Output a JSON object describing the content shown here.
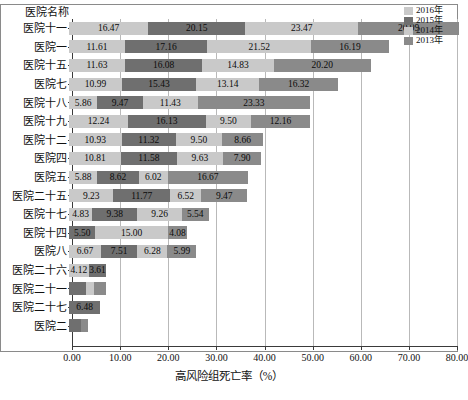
{
  "axis_header": "医院名称",
  "legend": {
    "position": "top-right",
    "items": [
      {
        "label": "2016年",
        "color": "#c9c9c9"
      },
      {
        "label": "2015年",
        "color": "#6f6f6f"
      },
      {
        "label": "2014年",
        "color": "#c9c9c9"
      },
      {
        "label": "2013年",
        "color": "#8a8a8a"
      }
    ]
  },
  "chart_data": {
    "type": "bar",
    "orientation": "horizontal",
    "stacked": true,
    "title": "",
    "xlabel": "高风险组死亡率（%）",
    "ylabel": "医院名称",
    "xlim": [
      0,
      80
    ],
    "xticks": [
      "0.00",
      "10.00",
      "20.00",
      "30.00",
      "40.00",
      "50.00",
      "60.00",
      "70.00",
      "80.00"
    ],
    "xtick_values": [
      0,
      10,
      20,
      30,
      40,
      50,
      60,
      70,
      80
    ],
    "grid": true,
    "series": [
      {
        "name": "2016年",
        "color": "#c9c9c9"
      },
      {
        "name": "2015年",
        "color": "#6f6f6f"
      },
      {
        "name": "2014年",
        "color": "#c9c9c9"
      },
      {
        "name": "2013年",
        "color": "#8a8a8a"
      }
    ],
    "categories": [
      "医院十一",
      "医院一",
      "医院十五",
      "医院七",
      "医院十八",
      "医院十九",
      "医院十二",
      "医院四",
      "医院五",
      "医院二十五",
      "医院十七",
      "医院十四",
      "医院八",
      "医院二十六",
      "医院二十一",
      "医院二十七",
      "医院二"
    ],
    "rows": [
      {
        "category": "医院十一",
        "segments": [
          {
            "series": "2016年",
            "value": 16.47,
            "label": "16.47"
          },
          {
            "series": "2015年",
            "value": 20.15,
            "label": "20.15"
          },
          {
            "series": "2014年",
            "value": 23.47,
            "label": "23.47"
          },
          {
            "series": "2013年",
            "value": 20.99,
            "label": "20.99"
          }
        ],
        "total": 81.08
      },
      {
        "category": "医院一",
        "segments": [
          {
            "series": "2016年",
            "value": 11.61,
            "label": "11.61"
          },
          {
            "series": "2015年",
            "value": 17.16,
            "label": "17.16"
          },
          {
            "series": "2014年",
            "value": 21.52,
            "label": "21.52"
          },
          {
            "series": "2013年",
            "value": 16.19,
            "label": "16.19"
          }
        ],
        "total": 66.48
      },
      {
        "category": "医院十五",
        "segments": [
          {
            "series": "2016年",
            "value": 11.63,
            "label": "11.63"
          },
          {
            "series": "2015年",
            "value": 16.08,
            "label": "16.08"
          },
          {
            "series": "2014年",
            "value": 14.83,
            "label": "14.83"
          },
          {
            "series": "2013年",
            "value": 20.2,
            "label": "20.20"
          }
        ],
        "total": 62.74
      },
      {
        "category": "医院七",
        "segments": [
          {
            "series": "2016年",
            "value": 10.99,
            "label": "10.99"
          },
          {
            "series": "2015年",
            "value": 15.43,
            "label": "15.43"
          },
          {
            "series": "2014年",
            "value": 13.14,
            "label": "13.14"
          },
          {
            "series": "2013年",
            "value": 16.32,
            "label": "16.32"
          }
        ],
        "total": 55.88
      },
      {
        "category": "医院十八",
        "segments": [
          {
            "series": "2016年",
            "value": 5.86,
            "label": "5.86"
          },
          {
            "series": "2015年",
            "value": 9.47,
            "label": "9.47"
          },
          {
            "series": "2014年",
            "value": 11.43,
            "label": "11.43"
          },
          {
            "series": "2013年",
            "value": 23.33,
            "label": "23.33"
          }
        ],
        "total": 50.09
      },
      {
        "category": "医院十九",
        "segments": [
          {
            "series": "2016年",
            "value": 12.24,
            "label": "12.24"
          },
          {
            "series": "2015年",
            "value": 16.13,
            "label": "16.13"
          },
          {
            "series": "2014年",
            "value": 9.5,
            "label": "9.50"
          },
          {
            "series": "2013年",
            "value": 12.16,
            "label": "12.16"
          }
        ],
        "total": 50.03
      },
      {
        "category": "医院十二",
        "segments": [
          {
            "series": "2016年",
            "value": 10.93,
            "label": "10.93"
          },
          {
            "series": "2015年",
            "value": 11.32,
            "label": "11.32"
          },
          {
            "series": "2014年",
            "value": 9.5,
            "label": "9.50"
          },
          {
            "series": "2013年",
            "value": 8.66,
            "label": "8.66"
          }
        ],
        "total": 40.41
      },
      {
        "category": "医院四",
        "segments": [
          {
            "series": "2016年",
            "value": 10.81,
            "label": "10.81"
          },
          {
            "series": "2015年",
            "value": 11.58,
            "label": "11.58"
          },
          {
            "series": "2014年",
            "value": 9.63,
            "label": "9.63"
          },
          {
            "series": "2013年",
            "value": 7.9,
            "label": "7.90"
          }
        ],
        "total": 39.92
      },
      {
        "category": "医院五",
        "segments": [
          {
            "series": "2016年",
            "value": 5.88,
            "label": "5.88"
          },
          {
            "series": "2015年",
            "value": 8.62,
            "label": "8.62"
          },
          {
            "series": "2014年",
            "value": 6.02,
            "label": "6.02"
          },
          {
            "series": "2013年",
            "value": 16.67,
            "label": "16.67"
          }
        ],
        "total": 37.19
      },
      {
        "category": "医院二十五",
        "segments": [
          {
            "series": "2016年",
            "value": 9.23,
            "label": "9.23"
          },
          {
            "series": "2015年",
            "value": 11.77,
            "label": "11.77"
          },
          {
            "series": "2014年",
            "value": 6.52,
            "label": "6.52"
          },
          {
            "series": "2013年",
            "value": 9.47,
            "label": "9.47"
          }
        ],
        "total": 36.99
      },
      {
        "category": "医院十七",
        "segments": [
          {
            "series": "2016年",
            "value": 4.83,
            "label": "4.83"
          },
          {
            "series": "2015年",
            "value": 9.38,
            "label": "9.38"
          },
          {
            "series": "2014年",
            "value": 9.26,
            "label": "9.26"
          },
          {
            "series": "2013年",
            "value": 5.54,
            "label": "5.54"
          }
        ],
        "total": 29.01
      },
      {
        "category": "医院十四",
        "segments": [
          {
            "series": "2015年",
            "value": 5.5,
            "label": "5.50"
          },
          {
            "series": "2014年",
            "value": 15.0,
            "label": "15.00"
          },
          {
            "series": "2013年",
            "value": 4.08,
            "label": "4.08"
          }
        ],
        "total": 24.58
      },
      {
        "category": "医院八",
        "segments": [
          {
            "series": "2016年",
            "value": 6.67,
            "label": "6.67"
          },
          {
            "series": "2015年",
            "value": 7.51,
            "label": "7.51"
          },
          {
            "series": "2014年",
            "value": 6.28,
            "label": "6.28"
          },
          {
            "series": "2013年",
            "value": 5.99,
            "label": "5.99"
          }
        ],
        "total": 26.45
      },
      {
        "category": "医院二十六",
        "segments": [
          {
            "series": "2016年",
            "value": 4.12,
            "label": "4.12"
          },
          {
            "series": "2015年",
            "value": 3.61,
            "label": "3.61"
          }
        ],
        "total": 7.73
      },
      {
        "category": "医院二十一",
        "segments": [
          {
            "series": "2015年",
            "value": 3.6,
            "label": ""
          },
          {
            "series": "2014年",
            "value": 1.6,
            "label": ""
          },
          {
            "series": "2013年",
            "value": 2.4,
            "label": ""
          }
        ],
        "total": 7.6
      },
      {
        "category": "医院二十七",
        "segments": [
          {
            "series": "2015年",
            "value": 6.48,
            "label": "6.48"
          }
        ],
        "total": 6.48
      },
      {
        "category": "医院二",
        "segments": [
          {
            "series": "2015年",
            "value": 2.4,
            "label": ""
          },
          {
            "series": "2013年",
            "value": 1.6,
            "label": ""
          }
        ],
        "total": 4.0
      }
    ]
  }
}
